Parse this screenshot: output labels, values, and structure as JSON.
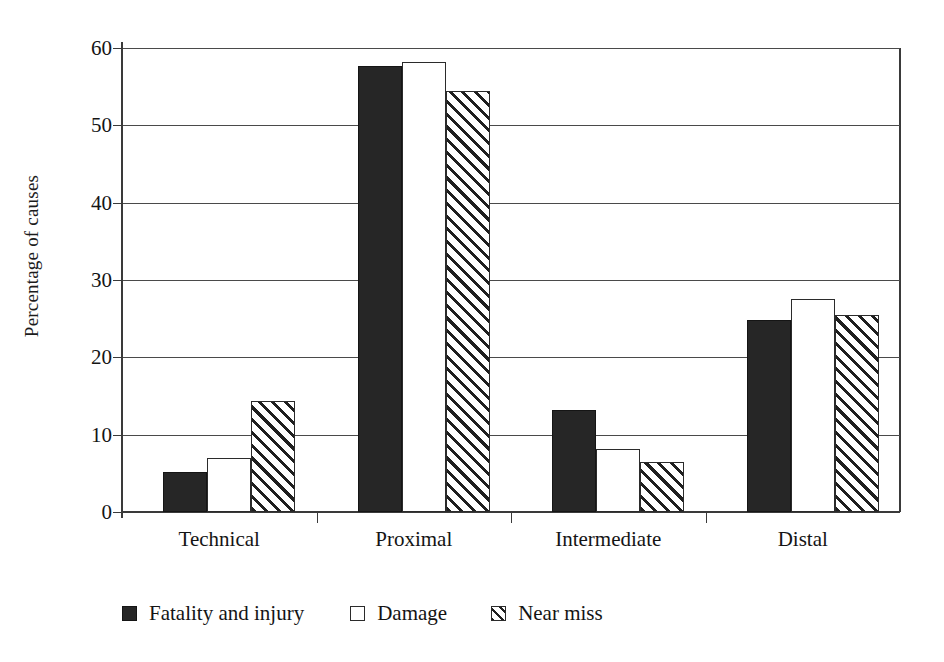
{
  "chart_data": {
    "type": "bar",
    "title": "",
    "subtitle": "",
    "xlabel": "",
    "ylabel": "Percentage of causes",
    "categories": [
      "Technical",
      "Proximal",
      "Intermediate",
      "Distal"
    ],
    "series": [
      {
        "name": "Fatality and injury",
        "style": "solid-black",
        "color": "#262626",
        "values": [
          5.2,
          57.7,
          13.2,
          24.8
        ]
      },
      {
        "name": "Damage",
        "style": "open-white",
        "color": "#ffffff",
        "values": [
          7.0,
          58.2,
          8.2,
          27.5
        ]
      },
      {
        "name": "Near miss",
        "style": "diagonal-hatch",
        "color": "#ffffff",
        "values": [
          14.4,
          54.5,
          6.5,
          25.5
        ]
      }
    ],
    "ylim": [
      0,
      60
    ],
    "yticks": [
      0,
      10,
      20,
      30,
      40,
      50,
      60
    ],
    "ytick_labels": [
      "0",
      "10",
      "20",
      "30",
      "40",
      "50",
      "60"
    ],
    "grid": "horizontal",
    "legend_position": "bottom-left",
    "legend_entries": [
      "Fatality and injury",
      "Damage",
      "Near miss"
    ]
  },
  "axes": {
    "y_title": "Percentage of causes"
  },
  "legend": {
    "items": [
      {
        "label": "Fatality and injury",
        "swatch": "solid-black-square-icon"
      },
      {
        "label": "Damage",
        "swatch": "open-white-square-icon"
      },
      {
        "label": "Near miss",
        "swatch": "hatched-square-icon"
      }
    ]
  }
}
